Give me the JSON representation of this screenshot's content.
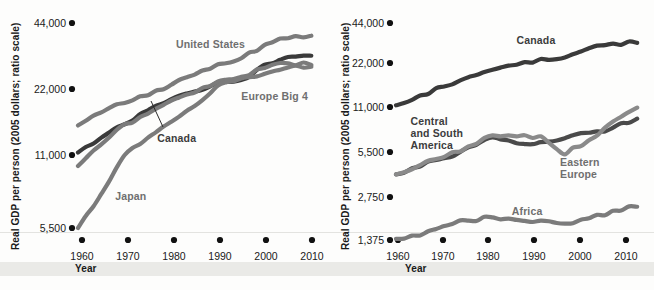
{
  "figure": {
    "background": "#fdfdfc",
    "ink_dark": "#3a3a3a",
    "ink_mid": "#7b7b7b",
    "ink_label_dark": "#3c3c3c",
    "ink_label_mid": "#6f6f6f"
  },
  "chart_data": [
    {
      "type": "line",
      "panel": "left",
      "title": "",
      "xlabel": "Year",
      "ylabel": "Real GDP per person (2005 dollars; ratio scale)",
      "scale": "log",
      "x": [
        1960,
        1965,
        1970,
        1975,
        1980,
        1985,
        1990,
        1995,
        2000,
        2005,
        2010
      ],
      "xticks": [
        "1960",
        "1970",
        "1980",
        "1990",
        "2000",
        "2010"
      ],
      "yticks": [
        "44,000",
        "22,000",
        "11,000",
        "5,500"
      ],
      "ytick_values": [
        44000,
        22000,
        11000,
        5500
      ],
      "ylim": [
        5500,
        48000
      ],
      "xlim": [
        1960,
        2011
      ],
      "grid": false,
      "legend_position": "inline-annotations",
      "series": [
        {
          "name": "United States",
          "color": "#7b7b7b",
          "label_x": 1981,
          "label_y": 34000,
          "values": [
            15000,
            17200,
            19000,
            20600,
            23000,
            25600,
            28500,
            30400,
            35000,
            37500,
            38500
          ]
        },
        {
          "name": "Canada",
          "color": "#3a3a3a",
          "label_x": 1977,
          "label_y": 12600,
          "leader": true,
          "values": [
            11300,
            13200,
            15200,
            17600,
            19800,
            21400,
            23600,
            24200,
            28400,
            30800,
            31200
          ]
        },
        {
          "name": "Europe Big 4",
          "color": "#7b7b7b",
          "label_x": 1995,
          "label_y": 19500,
          "values": [
            9900,
            12300,
            15200,
            17000,
            19500,
            21200,
            23800,
            25000,
            27400,
            28800,
            28300
          ]
        },
        {
          "name": "Japan",
          "color": "#7b7b7b",
          "label_x": 1968,
          "label_y": 7200,
          "values": [
            5500,
            7600,
            11000,
            13200,
            15600,
            18400,
            22800,
            24600,
            25800,
            27600,
            27800
          ]
        }
      ]
    },
    {
      "type": "line",
      "panel": "right",
      "title": "",
      "xlabel": "Year",
      "ylabel": "Real GDP per person (2005 dollars; ratio scale)",
      "scale": "log",
      "x": [
        1960,
        1965,
        1970,
        1975,
        1980,
        1985,
        1990,
        1995,
        2000,
        2005,
        2010
      ],
      "xticks": [
        "1960",
        "1970",
        "1980",
        "1990",
        "2000",
        "2010"
      ],
      "yticks": [
        "44,000",
        "22,000",
        "11,000",
        "5,500",
        "2,750",
        "1,375"
      ],
      "ytick_values": [
        44000,
        22000,
        11000,
        5500,
        2750,
        1375
      ],
      "ylim": [
        1375,
        48000
      ],
      "xlim": [
        1960,
        2011
      ],
      "grid": false,
      "legend_position": "inline-annotations",
      "series": [
        {
          "name": "Canada",
          "color": "#3a3a3a",
          "label_x": 1985,
          "label_y": 30500,
          "values": [
            11300,
            13200,
            15200,
            17600,
            19800,
            21400,
            23600,
            24200,
            28400,
            30800,
            31200
          ]
        },
        {
          "name": "Central and South America",
          "color": "#4a4a4a",
          "label_x": 1963,
          "label_y": 8300,
          "label_lines": [
            "Central",
            "and South",
            "America"
          ],
          "values": [
            3900,
            4400,
            5000,
            5900,
            6900,
            6300,
            6400,
            6800,
            7400,
            8000,
            9200
          ]
        },
        {
          "name": "Eastern Europe",
          "color": "#8a8a8a",
          "label_x": 1994,
          "label_y": 4400,
          "label_lines": [
            "Eastern",
            "Europe"
          ],
          "values": [
            3900,
            4500,
            5100,
            6000,
            7100,
            7000,
            7000,
            5300,
            6600,
            8800,
            10900
          ]
        },
        {
          "name": "Africa",
          "color": "#7b7b7b",
          "label_x": 1984,
          "label_y": 2050,
          "values": [
            1400,
            1480,
            1720,
            1880,
            1980,
            1900,
            1880,
            1790,
            1950,
            2200,
            2350
          ]
        }
      ]
    }
  ]
}
